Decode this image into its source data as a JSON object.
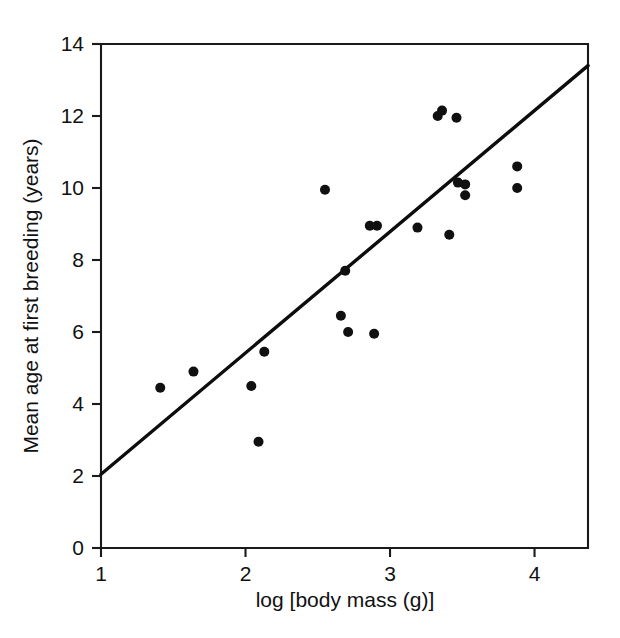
{
  "figure": {
    "background_color": "#ffffff",
    "foreground_color": "#101010"
  },
  "chart_data": {
    "type": "scatter",
    "title": "",
    "subtitle": "",
    "xlabel": "log [body mass (g)]",
    "ylabel": "Mean age at first breeding (years)",
    "xlim": [
      1,
      4.37
    ],
    "ylim": [
      0,
      14
    ],
    "xticks": [
      1,
      2,
      3,
      4
    ],
    "xtick_labels": [
      "1",
      "2",
      "3",
      "4"
    ],
    "yticks": [
      0,
      2,
      4,
      6,
      8,
      10,
      12,
      14
    ],
    "ytick_labels": [
      "0",
      "2",
      "4",
      "6",
      "8",
      "10",
      "12",
      "14"
    ],
    "grid": false,
    "legend": null,
    "marker": {
      "shape": "circle",
      "color": "#101010",
      "size_px": 9
    },
    "points": [
      {
        "x": 1.41,
        "y": 4.45
      },
      {
        "x": 1.64,
        "y": 4.9
      },
      {
        "x": 2.04,
        "y": 4.5
      },
      {
        "x": 2.09,
        "y": 2.95
      },
      {
        "x": 2.13,
        "y": 5.45
      },
      {
        "x": 2.55,
        "y": 9.95
      },
      {
        "x": 2.66,
        "y": 6.45
      },
      {
        "x": 2.69,
        "y": 7.7
      },
      {
        "x": 2.71,
        "y": 6.0
      },
      {
        "x": 2.86,
        "y": 8.95
      },
      {
        "x": 2.91,
        "y": 8.95
      },
      {
        "x": 2.89,
        "y": 5.95
      },
      {
        "x": 3.19,
        "y": 8.9
      },
      {
        "x": 3.33,
        "y": 12.0
      },
      {
        "x": 3.36,
        "y": 12.15
      },
      {
        "x": 3.46,
        "y": 11.95
      },
      {
        "x": 3.47,
        "y": 10.15
      },
      {
        "x": 3.52,
        "y": 10.1
      },
      {
        "x": 3.52,
        "y": 9.8
      },
      {
        "x": 3.41,
        "y": 8.7
      },
      {
        "x": 3.88,
        "y": 10.6
      },
      {
        "x": 3.88,
        "y": 10.0
      }
    ],
    "fit_line": {
      "type": "linear",
      "x_start": 1.0,
      "y_start": 2.05,
      "x_end": 4.37,
      "y_end": 13.4,
      "color": "#0d0d0d"
    }
  },
  "axes": {
    "frame": "open-top-right-box",
    "x_axis_name": "x-axis",
    "y_axis_name": "y-axis"
  }
}
